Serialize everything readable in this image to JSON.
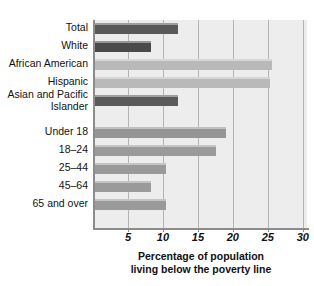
{
  "chart_data": {
    "type": "bar",
    "orientation": "horizontal",
    "title": "",
    "xlabel": "Percentage of population living below the poverty line",
    "ylabel": "",
    "xlim": [
      0,
      31
    ],
    "xticks": [
      5,
      10,
      15,
      20,
      25,
      30
    ],
    "xtick_labels": [
      "5",
      "10",
      "15",
      "20",
      "25",
      "30"
    ],
    "grid": true,
    "legend": false,
    "categories": [
      "Total",
      "White",
      "African American",
      "Hispanic",
      "Asian and Pacific Islander",
      "Under 18",
      "18–24",
      "25–44",
      "45–64",
      "65 and over"
    ],
    "values": [
      12.1,
      8.3,
      25.6,
      25.3,
      12.2,
      19.0,
      17.6,
      10.4,
      8.3,
      10.5
    ],
    "bar_colors": [
      "#595959",
      "#4a4a4a",
      "#b9b9b9",
      "#b9b9b9",
      "#5a5a5a",
      "#959595",
      "#9a9a9a",
      "#9a9a9a",
      "#9a9a9a",
      "#9a9a9a"
    ],
    "group_breaks_after": [
      "Asian and Pacific Islander"
    ]
  },
  "axis_title": {
    "line1": "Percentage of population",
    "line2": "living below the poverty line"
  },
  "colors": {
    "plot_background": "#ededed",
    "page_background": "#ffffff",
    "gridline": "#b4b4b4",
    "axis": "#8c8c8c",
    "bar_shadow": "#c9c9c9",
    "text": "#111111"
  }
}
